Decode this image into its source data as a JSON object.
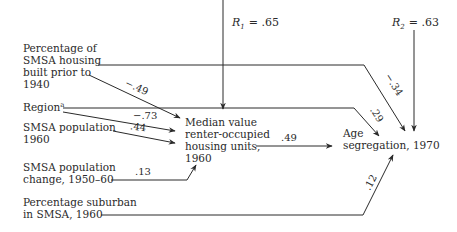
{
  "diagram": {
    "type": "path-analysis",
    "nodes": {
      "housing_pre1940": {
        "lines": [
          "Percentage of",
          "SMSA housing",
          "built prior to",
          "1940"
        ]
      },
      "region": {
        "label": "Region",
        "superscript": "a"
      },
      "smsa_pop": {
        "lines": [
          "SMSA population",
          "1960"
        ]
      },
      "smsa_pop_change": {
        "lines": [
          "SMSA population",
          "change, 1950–60"
        ]
      },
      "pct_suburban": {
        "lines": [
          "Percentage suburban",
          "in SMSA, 1960"
        ]
      },
      "median_value": {
        "lines": [
          "Median value",
          "renter-occupied",
          "housing units,",
          "1960"
        ]
      },
      "age_segregation": {
        "lines": [
          "Age",
          "segregation, 1970"
        ]
      }
    },
    "residuals": {
      "r1": {
        "symbol": "R",
        "sub": "1",
        "value": "= .65"
      },
      "r2": {
        "symbol": "R",
        "sub": "2",
        "value": "= .63"
      }
    },
    "edges": [
      {
        "from": "housing_pre1940",
        "to": "median_value",
        "coef": "−.49"
      },
      {
        "from": "region",
        "to": "median_value",
        "coef": "−.73"
      },
      {
        "from": "smsa_pop",
        "to": "median_value",
        "coef": ".44"
      },
      {
        "from": "smsa_pop_change",
        "to": "median_value",
        "coef": ".13"
      },
      {
        "from": "median_value",
        "to": "age_segregation",
        "coef": ".49"
      },
      {
        "from": "housing_pre1940",
        "to": "age_segregation",
        "coef": "−.34"
      },
      {
        "from": "region",
        "to": "age_segregation",
        "coef": ".29"
      },
      {
        "from": "pct_suburban",
        "to": "age_segregation",
        "coef": ".12"
      }
    ],
    "color": "#2a2a2a"
  }
}
